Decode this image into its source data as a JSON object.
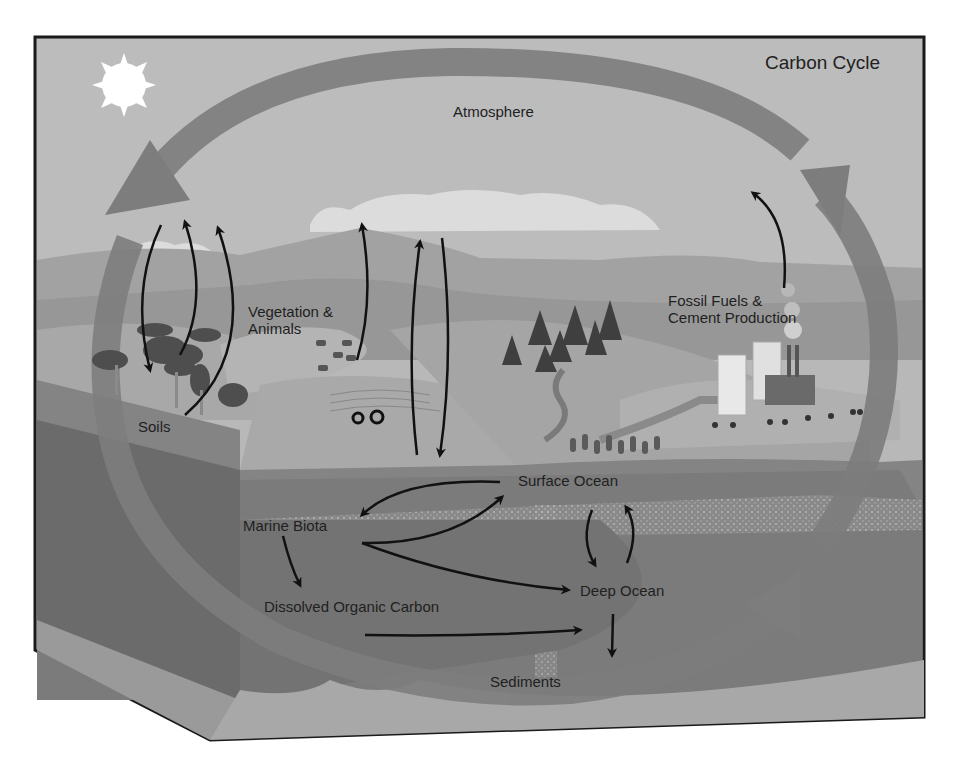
{
  "title": "Carbon Cycle",
  "colors": {
    "sky": "#b9b9b9",
    "cycle_arrow": "#7a7a7a",
    "ocean": "#7e7e7e",
    "deep_ocean": "#6c6c6c",
    "land": "#9a9a9a",
    "outline": "#1a1a1a",
    "sun": "#ffffff"
  },
  "labels": {
    "atmosphere": "Atmosphere",
    "vegetation": "Vegetation &\nAnimals",
    "soils": "Soils",
    "fossil": "Fossil Fuels &\nCement Production",
    "surface_ocean": "Surface Ocean",
    "marine_biota": "Marine Biota",
    "deep_ocean": "Deep Ocean",
    "doc": "Dissolved Organic Carbon",
    "sediments": "Sediments"
  },
  "icons": [
    "sun-icon",
    "tree-icon",
    "animal-icon",
    "tractor-icon",
    "factory-icon",
    "building-icon",
    "car-icon",
    "cloud-icon"
  ],
  "flows": [
    {
      "from": "Atmosphere",
      "to": "Soils"
    },
    {
      "from": "Soils",
      "to": "Atmosphere"
    },
    {
      "from": "Vegetation & Animals",
      "to": "Atmosphere"
    },
    {
      "from": "Surface Ocean",
      "to": "Atmosphere"
    },
    {
      "from": "Atmosphere",
      "to": "Surface Ocean"
    },
    {
      "from": "Fossil Fuels & Cement Production",
      "to": "Atmosphere"
    },
    {
      "from": "Surface Ocean",
      "to": "Marine Biota"
    },
    {
      "from": "Marine Biota",
      "to": "Surface Ocean"
    },
    {
      "from": "Marine Biota",
      "to": "Deep Ocean"
    },
    {
      "from": "Marine Biota",
      "to": "Dissolved Organic Carbon"
    },
    {
      "from": "Dissolved Organic Carbon",
      "to": "Deep Ocean"
    },
    {
      "from": "Surface Ocean",
      "to": "Deep Ocean"
    },
    {
      "from": "Deep Ocean",
      "to": "Surface Ocean"
    },
    {
      "from": "Deep Ocean",
      "to": "Sediments"
    }
  ]
}
